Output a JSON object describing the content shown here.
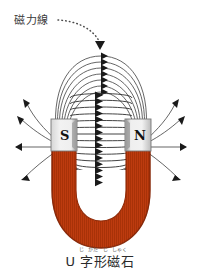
{
  "figure": {
    "title_label": "磁力線",
    "caption": {
      "text": "U 字形磁石",
      "ruby": "じ がた じしゃく",
      "ruby_parts": [
        "じ",
        "がた",
        "じ",
        "しゃく"
      ]
    },
    "magnet": {
      "type": "U-shaped horseshoe magnet",
      "body_color": "#bd3b0f",
      "body_edge_color": "#8f2a08",
      "pole_block_color": "#e8e8e8",
      "pole_block_shadow": "#9a9a9a",
      "poles": [
        {
          "label": "S",
          "side": "left"
        },
        {
          "label": "N",
          "side": "right"
        }
      ]
    },
    "field_lines": {
      "color": "#4a4a4a",
      "arrow_color": "#1a1a1a",
      "direction": "N to S",
      "inner_arc_count": 16,
      "outer_arc_count": 7,
      "side_ray_count": 8
    },
    "annotation": {
      "pointer_style": "dotted-arrow",
      "pointer_color": "#4a4a4a"
    }
  }
}
